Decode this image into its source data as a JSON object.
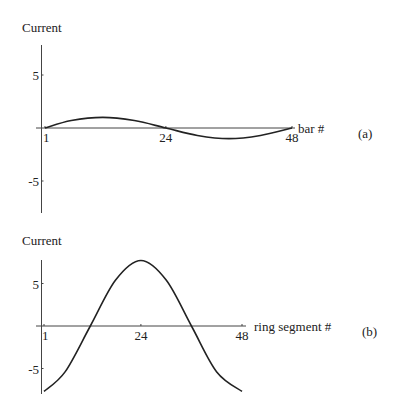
{
  "chart_data": [
    {
      "type": "line",
      "panel_label": "(a)",
      "ylabel": "Current",
      "xlabel": "bar #",
      "xlim": [
        1,
        48
      ],
      "ylim": [
        -8,
        8
      ],
      "xticks": [
        1,
        24,
        48
      ],
      "xtick_labels": [
        "1",
        "24",
        "48"
      ],
      "yticks": [
        5,
        -5
      ],
      "ytick_labels": [
        "5",
        "-5"
      ],
      "grid": false,
      "series": [
        {
          "name": "current",
          "x": [
            1,
            6,
            12,
            18,
            24,
            30,
            36,
            42,
            48
          ],
          "y": [
            0,
            0.7,
            1.0,
            0.7,
            0,
            -0.7,
            -1.0,
            -0.7,
            0
          ]
        }
      ]
    },
    {
      "type": "line",
      "panel_label": "(b)",
      "ylabel": "Current",
      "xlabel": "ring segment #",
      "xlim": [
        1,
        48
      ],
      "ylim": [
        -8,
        8
      ],
      "xticks": [
        1,
        24,
        48
      ],
      "xtick_labels": [
        "1",
        "24",
        "48"
      ],
      "yticks": [
        5,
        -5
      ],
      "ytick_labels": [
        "5",
        "-5"
      ],
      "grid": false,
      "series": [
        {
          "name": "current",
          "x": [
            1,
            6,
            12,
            18,
            24,
            30,
            36,
            42,
            48
          ],
          "y": [
            -7.7,
            -5.4,
            0,
            5.4,
            7.7,
            5.4,
            0,
            -5.4,
            -7.7
          ]
        }
      ]
    }
  ]
}
